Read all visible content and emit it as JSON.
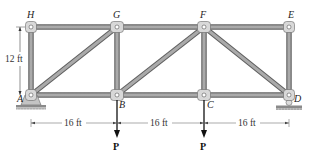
{
  "figure": {
    "type": "truss",
    "joints": {
      "H": {
        "label": "H"
      },
      "G": {
        "label": "G"
      },
      "F": {
        "label": "F"
      },
      "E": {
        "label": "E"
      },
      "A": {
        "label": "A"
      },
      "B": {
        "label": "B"
      },
      "C": {
        "label": "C"
      },
      "D": {
        "label": "D"
      }
    },
    "members": [
      [
        "H",
        "G"
      ],
      [
        "G",
        "F"
      ],
      [
        "F",
        "E"
      ],
      [
        "A",
        "B"
      ],
      [
        "B",
        "C"
      ],
      [
        "C",
        "D"
      ],
      [
        "A",
        "H"
      ],
      [
        "B",
        "G"
      ],
      [
        "C",
        "F"
      ],
      [
        "D",
        "E"
      ],
      [
        "A",
        "G"
      ],
      [
        "B",
        "F"
      ],
      [
        "F",
        "D"
      ]
    ],
    "supports": {
      "A": "pin",
      "D": "roller"
    },
    "loads": [
      {
        "joint": "B",
        "label": "P",
        "direction": "down"
      },
      {
        "joint": "C",
        "label": "P",
        "direction": "down"
      }
    ],
    "dimensions": {
      "height": "12 ft",
      "spans": [
        "16 ft",
        "16 ft",
        "16 ft"
      ]
    },
    "colors": {
      "member": "#9a9a9a",
      "member_edge": "#5e5e5e",
      "joint": "#d8d8d8",
      "ground": "#8a8a8a"
    }
  }
}
